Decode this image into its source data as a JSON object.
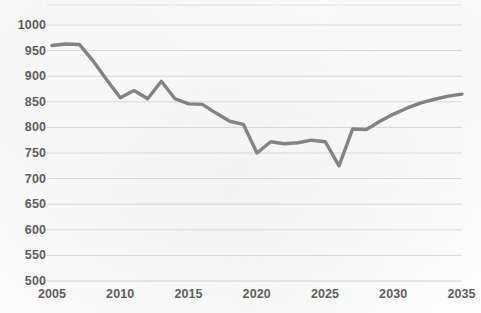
{
  "chart_data": {
    "type": "line",
    "title": "",
    "subtitle": "",
    "xlabel": "",
    "ylabel": "",
    "xlim": [
      2005,
      2035
    ],
    "ylim": [
      500,
      1000
    ],
    "grid": "horizontal",
    "legend": "none",
    "y_ticks": [
      1000,
      950,
      900,
      850,
      800,
      750,
      700,
      650,
      600,
      550,
      500
    ],
    "x_ticks": [
      2005,
      2010,
      2015,
      2020,
      2025,
      2030,
      2035
    ],
    "series": [
      {
        "name": "series-1",
        "color": "#808080",
        "x": [
          2005,
          2006,
          2007,
          2008,
          2009,
          2010,
          2011,
          2012,
          2013,
          2014,
          2015,
          2016,
          2017,
          2018,
          2019,
          2020,
          2021,
          2022,
          2023,
          2024,
          2025,
          2026,
          2027,
          2028,
          2029,
          2030,
          2031,
          2032,
          2033,
          2034,
          2035
        ],
        "values": [
          960,
          963,
          962,
          930,
          893,
          858,
          872,
          856,
          890,
          856,
          846,
          845,
          828,
          812,
          806,
          750,
          772,
          768,
          770,
          775,
          772,
          725,
          797,
          796,
          812,
          826,
          838,
          848,
          855,
          861,
          865
        ]
      }
    ]
  },
  "axis": {
    "y_labels": [
      "1000",
      "950",
      "900",
      "850",
      "800",
      "750",
      "700",
      "650",
      "600",
      "550",
      "500"
    ],
    "x_labels": [
      "2005",
      "2010",
      "2015",
      "2020",
      "2025",
      "2030",
      "2035"
    ]
  },
  "style": {
    "line_color": "#808080",
    "grid_color": "#d9d9d9",
    "label_color": "#5d5d5d",
    "background": "#fdfdfd"
  }
}
